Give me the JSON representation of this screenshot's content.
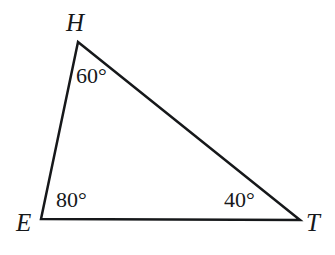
{
  "figure": {
    "type": "triangle-diagram",
    "name": "Triangle EHT",
    "background_color": "#ffffff",
    "stroke_color": "#16181a",
    "stroke_width": 2.5,
    "canvas": {
      "width": 335,
      "height": 255
    }
  },
  "vertices": [
    {
      "id": "H",
      "label": "H",
      "x": 78,
      "y": 42,
      "label_x": 66,
      "label_y": 10
    },
    {
      "id": "E",
      "label": "E",
      "x": 41,
      "y": 219,
      "label_x": 16,
      "label_y": 210
    },
    {
      "id": "T",
      "label": "T",
      "x": 300,
      "y": 220,
      "label_x": 306,
      "label_y": 210
    }
  ],
  "edges": [
    {
      "id": "EH",
      "from": "E",
      "to": "H"
    },
    {
      "id": "HT",
      "from": "H",
      "to": "T"
    },
    {
      "id": "ET",
      "from": "E",
      "to": "T"
    }
  ],
  "angles": [
    {
      "at": "H",
      "value": 60,
      "label": "60°",
      "label_x": 76,
      "label_y": 65
    },
    {
      "at": "E",
      "value": 80,
      "label": "80°",
      "label_x": 56,
      "label_y": 189
    },
    {
      "at": "T",
      "value": 40,
      "label": "40°",
      "label_x": 224,
      "label_y": 189
    }
  ]
}
